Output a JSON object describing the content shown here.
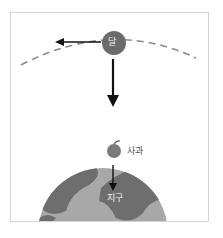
{
  "diagram": {
    "moon": {
      "label": "달",
      "color": "#6b6b6b"
    },
    "apple": {
      "label": "사과",
      "color": "#7a7a7a"
    },
    "earth": {
      "label": "지구",
      "ocean_color": "#a8a8a8",
      "land_color": "#6e6e6e"
    },
    "orbit": {
      "style": "dashed",
      "color": "#8a8a8a"
    },
    "arrows": [
      {
        "name": "moon-tangential-velocity",
        "direction": "left"
      },
      {
        "name": "moon-gravity-toward-earth",
        "direction": "down"
      },
      {
        "name": "apple-gravity-toward-earth",
        "direction": "down"
      }
    ]
  }
}
